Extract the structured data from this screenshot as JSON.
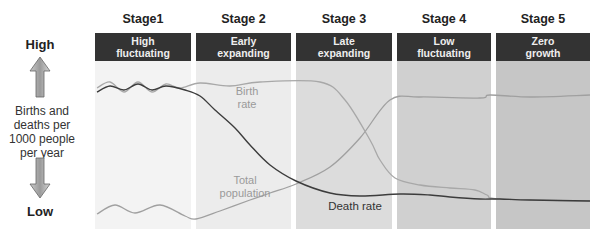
{
  "y_axis": {
    "high_label": "High",
    "low_label": "Low",
    "title": "Births and deaths per 1000 people per year",
    "title_lines": [
      "Births and",
      "deaths per",
      "1000 people",
      "per year"
    ]
  },
  "stages": [
    {
      "title": "Stage1",
      "head_lines": [
        "High",
        "fluctuating"
      ],
      "x": 95,
      "w": 96,
      "bg": "#f3f3f3"
    },
    {
      "title": "Stage 2",
      "head_lines": [
        "Early",
        "expanding"
      ],
      "x": 196,
      "w": 95,
      "bg": "#ececec"
    },
    {
      "title": "Stage 3",
      "head_lines": [
        "Late",
        "expanding"
      ],
      "x": 296,
      "w": 96,
      "bg": "#dcdcdc"
    },
    {
      "title": "Stage 4",
      "head_lines": [
        "Low",
        "fluctuating"
      ],
      "x": 397,
      "w": 94,
      "bg": "#d0d0d0"
    },
    {
      "title": "Stage 5",
      "head_lines": [
        "Zero",
        "growth"
      ],
      "x": 496,
      "w": 94,
      "bg": "#c6c6c6"
    }
  ],
  "labels": {
    "birth_rate": [
      "Birth",
      "rate"
    ],
    "total_population": [
      "Total",
      "population"
    ],
    "death_rate": "Death rate"
  },
  "colors": {
    "birth_rate": "#a8a8a8",
    "death_rate": "#3c3c3c",
    "total_population": "#a0a0a0",
    "header_bg": "#333333"
  },
  "chart_data": {
    "type": "line",
    "ylabel": "Births and deaths per 1000 people per year",
    "ylim": [
      "Low",
      "High"
    ],
    "categories": [
      "Stage1: High fluctuating",
      "Stage 2: Early expanding",
      "Stage 3: Late expanding",
      "Stage 4: Low fluctuating",
      "Stage 5: Zero growth"
    ],
    "series": [
      {
        "name": "Birth rate",
        "points": [
          [
            97,
            88
          ],
          [
            110,
            82
          ],
          [
            124,
            92
          ],
          [
            138,
            82
          ],
          [
            152,
            92
          ],
          [
            166,
            84
          ],
          [
            180,
            88
          ],
          [
            200,
            83
          ],
          [
            230,
            86
          ],
          [
            260,
            82
          ],
          [
            320,
            82
          ],
          [
            345,
            100
          ],
          [
            370,
            140
          ],
          [
            380,
            160
          ],
          [
            395,
            178
          ],
          [
            420,
            185
          ],
          [
            450,
            188
          ],
          [
            475,
            190
          ],
          [
            487,
            195
          ],
          [
            500,
            199
          ],
          [
            590,
            201
          ]
        ]
      },
      {
        "name": "Death rate",
        "points": [
          [
            97,
            92
          ],
          [
            110,
            86
          ],
          [
            124,
            90
          ],
          [
            138,
            84
          ],
          [
            152,
            90
          ],
          [
            166,
            86
          ],
          [
            185,
            90
          ],
          [
            200,
            96
          ],
          [
            215,
            110
          ],
          [
            235,
            128
          ],
          [
            250,
            145
          ],
          [
            270,
            165
          ],
          [
            296,
            181
          ],
          [
            330,
            193
          ],
          [
            360,
            196
          ],
          [
            400,
            194
          ],
          [
            430,
            195
          ],
          [
            450,
            197
          ],
          [
            480,
            199
          ],
          [
            500,
            199
          ],
          [
            530,
            200
          ],
          [
            590,
            201
          ]
        ]
      },
      {
        "name": "Total population",
        "points": [
          [
            97,
            214
          ],
          [
            115,
            205
          ],
          [
            135,
            213
          ],
          [
            160,
            205
          ],
          [
            185,
            216
          ],
          [
            196,
            219
          ],
          [
            220,
            211
          ],
          [
            250,
            200
          ],
          [
            270,
            193
          ],
          [
            296,
            184
          ],
          [
            330,
            167
          ],
          [
            360,
            138
          ],
          [
            390,
            100
          ],
          [
            420,
            97
          ],
          [
            480,
            98
          ],
          [
            490,
            95
          ],
          [
            530,
            97
          ],
          [
            590,
            95
          ]
        ]
      }
    ],
    "annotations": [
      "Birth rate",
      "Total population",
      "Death rate"
    ],
    "grid": false,
    "legend": "inline labels"
  }
}
